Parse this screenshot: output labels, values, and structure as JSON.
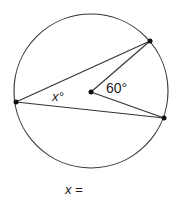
{
  "diagram": {
    "circle": {
      "cx": 91,
      "cy": 91,
      "r": 77
    },
    "center": {
      "x": 91,
      "y": 92
    },
    "points": {
      "left": {
        "x": 16,
        "y": 102
      },
      "top_right": {
        "x": 150,
        "y": 41
      },
      "bottom_right": {
        "x": 164,
        "y": 118
      }
    },
    "labels": {
      "inscribed_angle": "x°",
      "central_angle": "60°"
    }
  },
  "question": {
    "prompt": "x ="
  },
  "colors": {
    "stroke": "#333333",
    "dot": "#111111"
  }
}
